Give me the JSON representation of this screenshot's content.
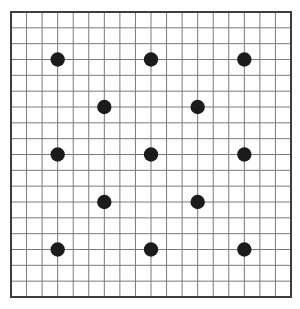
{
  "figure": {
    "name": "dot-pattern-on-grid",
    "background_color": "#ffffff",
    "canvas": {
      "width": 300,
      "height": 309
    },
    "grid": {
      "x": 11,
      "y": 12,
      "width": 280,
      "height": 285,
      "columns": 18,
      "rows": 18,
      "line_color": "#7a7a7a",
      "line_width": 1,
      "border_color": "#3d3d3d",
      "border_width": 2
    },
    "dots": {
      "color": "#1b1b1b",
      "radius": 7.2,
      "count": 13,
      "grid_points": [
        [
          3,
          3
        ],
        [
          9,
          3
        ],
        [
          15,
          3
        ],
        [
          6,
          6
        ],
        [
          12,
          6
        ],
        [
          3,
          9
        ],
        [
          9,
          9
        ],
        [
          15,
          9
        ],
        [
          6,
          12
        ],
        [
          12,
          12
        ],
        [
          3,
          15
        ],
        [
          9,
          15
        ],
        [
          15,
          15
        ]
      ]
    }
  }
}
